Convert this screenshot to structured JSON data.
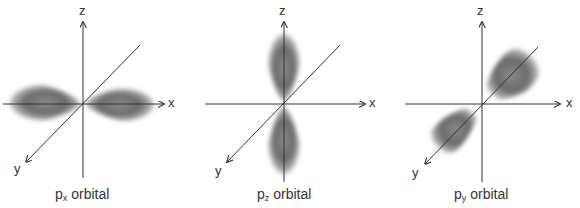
{
  "figure": {
    "axis_labels": {
      "x": "x",
      "y": "y",
      "z": "z"
    },
    "colors": {
      "lobe": "#6e6e6e",
      "axis": "#333333",
      "background": "#ffffff"
    },
    "panels": [
      {
        "id": "px",
        "caption_main": "p",
        "caption_sub": "x",
        "caption_rest": " orbital",
        "lobe_axis": "x"
      },
      {
        "id": "pz",
        "caption_main": "p",
        "caption_sub": "z",
        "caption_rest": " orbital",
        "lobe_axis": "z"
      },
      {
        "id": "py",
        "caption_main": "p",
        "caption_sub": "y",
        "caption_rest": " orbital",
        "lobe_axis": "y"
      }
    ]
  }
}
